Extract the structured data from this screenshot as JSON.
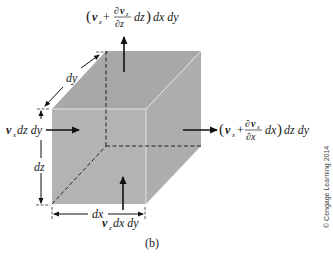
{
  "figure": {
    "label": "(b)",
    "copyright": "© Cengage Learning 2014",
    "colors": {
      "cube_fill": "#b4b4b4",
      "cube_top": "#a9a9a9",
      "cube_side": "#adadad",
      "edge_highlight": "#e6e6e6",
      "arrow": "#111111"
    }
  },
  "labels": {
    "top_flux": {
      "v": "v",
      "sub": "z",
      "plus": " + ",
      "num": "∂v",
      "num_sub": "z",
      "den": "∂z",
      "rest": " dz) dx dy"
    },
    "right_flux": {
      "v": "v",
      "sub": "x",
      "plus": " + ",
      "num": "∂v",
      "num_sub": "x",
      "den": "∂x",
      "rest": " dx) dz dy"
    },
    "left_flux": {
      "v": "v",
      "sub": "x",
      "rest": " dz dy"
    },
    "bottom_flux": {
      "v": "v",
      "sub": "z",
      "rest": " dx dy"
    },
    "dim_dx": "dx",
    "dim_dy": "dy",
    "dim_dz": "dz"
  }
}
